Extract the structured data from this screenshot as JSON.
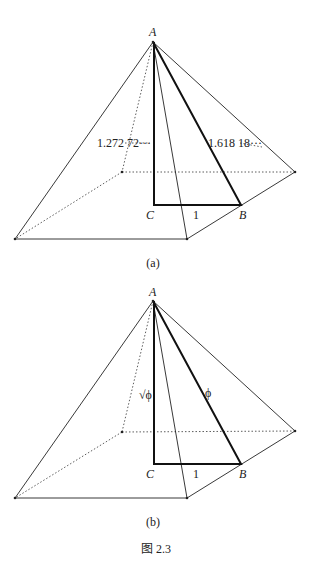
{
  "figure": {
    "caption": "图 2.3",
    "panels": [
      {
        "id": "a",
        "caption": "(a)",
        "points": {
          "A": "A",
          "B": "B",
          "C": "C"
        },
        "labels": {
          "height": "1.272 72···",
          "slant": "1.618 18···",
          "base": "1"
        }
      },
      {
        "id": "b",
        "caption": "(b)",
        "points": {
          "A": "A",
          "B": "B",
          "C": "C"
        },
        "labels": {
          "height": "√ϕ",
          "slant": "ϕ",
          "base": "1"
        }
      }
    ]
  },
  "colors": {
    "line": "#222222",
    "background": "#ffffff"
  }
}
